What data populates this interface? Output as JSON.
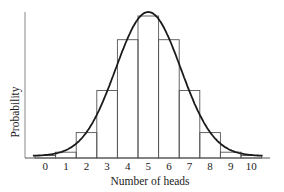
{
  "chart_data": {
    "type": "bar",
    "subtype": "histogram with overlaid normal curve",
    "title": "",
    "xlabel": "Number of heads",
    "ylabel": "Probability",
    "categories": [
      "0",
      "1",
      "2",
      "3",
      "4",
      "5",
      "6",
      "7",
      "8",
      "9",
      "10"
    ],
    "series": [
      {
        "name": "Binomial probability (n=10, p=0.5)",
        "values": [
          0.001,
          0.01,
          0.044,
          0.117,
          0.205,
          0.246,
          0.205,
          0.117,
          0.044,
          0.01,
          0.001
        ]
      },
      {
        "name": "Normal approximation curve",
        "type": "line",
        "mean": 5,
        "sd": 1.58
      }
    ],
    "ylim": [
      0,
      0.25
    ],
    "y_tick_labels_shown": false,
    "grid": false,
    "legend": null
  },
  "colors": {
    "bar_stroke": "#555555",
    "curve": "#1a1a1a",
    "axis": "#777777",
    "text": "#222222"
  }
}
